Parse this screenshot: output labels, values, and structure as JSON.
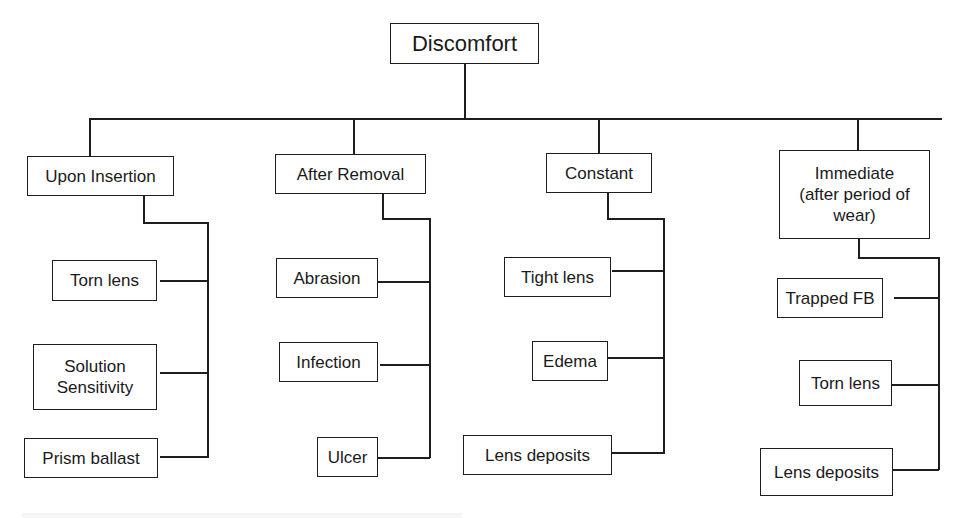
{
  "diagram": {
    "root": {
      "label": "Discomfort"
    },
    "categories": [
      {
        "label": "Upon Insertion",
        "children": [
          "Torn lens",
          "Solution Sensitivity",
          "Prism ballast"
        ]
      },
      {
        "label": "After Removal",
        "children": [
          "Abrasion",
          "Infection",
          "Ulcer"
        ]
      },
      {
        "label": "Constant",
        "children": [
          "Tight lens",
          "Edema",
          "Lens deposits"
        ]
      },
      {
        "label": "Immediate (after period of wear)",
        "children": [
          "Trapped FB",
          "Torn lens",
          "Lens deposits"
        ]
      }
    ]
  },
  "labels": {
    "root": "Discomfort",
    "c1": "Upon Insertion",
    "c1_1": "Torn lens",
    "c1_2a": "Solution",
    "c1_2b": "Sensitivity",
    "c1_3": "Prism ballast",
    "c2": "After Removal",
    "c2_1": "Abrasion",
    "c2_2": "Infection",
    "c2_3": "Ulcer",
    "c3": "Constant",
    "c3_1": "Tight lens",
    "c3_2": "Edema",
    "c3_3": "Lens deposits",
    "c4a": "Immediate",
    "c4b": "(after period of",
    "c4c": "wear)",
    "c4_1": "Trapped FB",
    "c4_2": "Torn lens",
    "c4_3": "Lens deposits"
  }
}
